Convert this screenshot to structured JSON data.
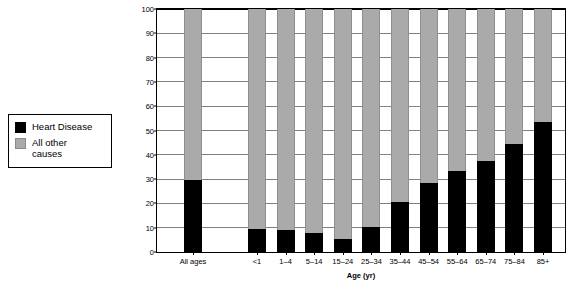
{
  "legend": {
    "title": "chart-legend",
    "entries": [
      {
        "label": "Heart Disease",
        "color": "#000000",
        "icon": "black-square-swatch"
      },
      {
        "label": "All other\ncauses",
        "color": "#aaaaaa",
        "icon": "grey-square-swatch"
      }
    ]
  },
  "chart_data": {
    "type": "bar",
    "subtype": "stacked-100-percent",
    "title": "",
    "xlabel": "Age (yr)",
    "ylabel": "Percent of all deaths",
    "ylim": [
      0,
      100
    ],
    "ytick_interval": 10,
    "yticks": [
      "0",
      "10",
      "20",
      "30",
      "40",
      "50",
      "60",
      "70",
      "80",
      "90",
      "100"
    ],
    "grid": true,
    "legend_position": "outside-left",
    "categories": [
      "All ages",
      "<1",
      "1–4",
      "5–14",
      "15–24",
      "25–34",
      "35–44",
      "45–54",
      "55–64",
      "65–74",
      "75–84",
      "85+"
    ],
    "series": [
      {
        "name": "Heart Disease",
        "color": "#000000",
        "values": [
          29.5,
          9.5,
          9.0,
          7.8,
          5.2,
          10.4,
          20.5,
          28.5,
          33.2,
          37.5,
          44.5,
          53.5
        ]
      },
      {
        "name": "All other causes",
        "color": "#aaaaaa",
        "values": [
          70.5,
          90.5,
          91.0,
          92.2,
          94.8,
          89.6,
          79.5,
          71.5,
          66.8,
          62.5,
          55.5,
          46.5
        ]
      }
    ]
  }
}
